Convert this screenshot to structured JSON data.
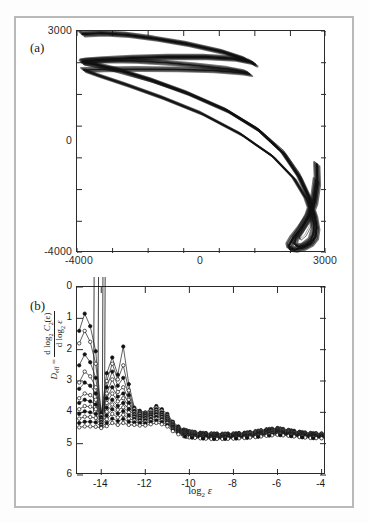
{
  "figure": {
    "panel_a": {
      "label": "(a)",
      "x_ticks": [
        "-4000",
        "0",
        "3000"
      ],
      "y_ticks": [
        "3000",
        "0",
        "-4000"
      ]
    },
    "panel_b": {
      "label": "(b)",
      "xlabel_base": "log",
      "xlabel_sub": "2",
      "xlabel_var": "ε",
      "ylabel_lhs": "D",
      "ylabel_lhs_sub": "eff",
      "ylabel_eq": "=",
      "ylabel_num_d": "d log",
      "ylabel_num_sub": "2",
      "ylabel_num_c": "C",
      "ylabel_num_csub": "2",
      "ylabel_num_eps": "(ε)",
      "ylabel_den_d": "d log",
      "ylabel_den_sub": "2",
      "ylabel_den_eps": "ε",
      "x_ticks": [
        "-14",
        "-12",
        "-10",
        "-8",
        "-6",
        "-4"
      ],
      "y_ticks": [
        "6",
        "5",
        "4",
        "3",
        "2",
        "1",
        "0"
      ]
    },
    "colors": {
      "axis": "#2a2a2a",
      "curve": "#111111",
      "page_border": "#b9b9b9",
      "background": "#ffffff"
    }
  },
  "chart_data": [
    {
      "type": "line",
      "title": "(a) Reconstructed attractor phase portrait",
      "xlabel": "",
      "ylabel": "",
      "xlim": [
        -4000,
        3000
      ],
      "ylim": [
        -4000,
        3000
      ],
      "x_ticks": [
        -4000,
        0,
        3000
      ],
      "y_ticks": [
        -4000,
        0,
        3000
      ],
      "grid": false,
      "legend": "none",
      "description": "Dense chaotic trajectory: a folded double-lobed band entering from upper-left near y=3000 and y=2000, sweeping right and downward through y=0 near x=2000, then looping into a narrow hairpin near (2000,-3800) and returning upward along x=2700.",
      "series": [
        {
          "name": "attractor-outer-band",
          "x": [
            -3850,
            -3300,
            -2600,
            -1800,
            -900,
            100,
            700,
            1000,
            900,
            400,
            -400,
            -1400,
            -2400,
            -3200,
            -3700,
            -3850,
            -3500,
            -2800,
            -1900,
            -900,
            200,
            1100,
            1800,
            2250,
            2520,
            2680,
            2740,
            2700,
            2560,
            2340,
            2120,
            1980,
            1960,
            2060,
            2260,
            2500,
            2680,
            2760,
            2740
          ],
          "y": [
            2900,
            2930,
            2880,
            2760,
            2590,
            2340,
            2120,
            1950,
            2020,
            2130,
            2180,
            2180,
            2150,
            2100,
            2060,
            2010,
            1950,
            1760,
            1450,
            1040,
            500,
            -120,
            -850,
            -1600,
            -2250,
            -2800,
            -3200,
            -3500,
            -3700,
            -3830,
            -3890,
            -3870,
            -3760,
            -3560,
            -3280,
            -2900,
            -2400,
            -1800,
            -1200
          ]
        },
        {
          "name": "attractor-inner-band",
          "x": [
            -3840,
            -3200,
            -2400,
            -1500,
            -600,
            300,
            760,
            860,
            600,
            -200,
            -1200,
            -2300,
            -3300,
            -3820,
            -3400,
            -2600,
            -1600,
            -500,
            600,
            1500,
            2100,
            2450,
            2620,
            2660,
            2580,
            2400,
            2220,
            2120,
            2140,
            2280,
            2490,
            2650,
            2720
          ],
          "y": [
            2050,
            2080,
            2060,
            2000,
            1910,
            1800,
            1700,
            1640,
            1690,
            1760,
            1790,
            1800,
            1790,
            1770,
            1600,
            1300,
            900,
            400,
            -250,
            -950,
            -1650,
            -2300,
            -2850,
            -3300,
            -3600,
            -3760,
            -3800,
            -3720,
            -3540,
            -3280,
            -2850,
            -2300,
            -1700
          ]
        },
        {
          "name": "attractor-thin-strand",
          "x": [
            -3840,
            -3000,
            -2000,
            -900,
            200,
            1100,
            1800,
            2250,
            2500,
            2600,
            2560,
            2420,
            2280,
            2230,
            2320,
            2520,
            2700
          ],
          "y": [
            1960,
            1740,
            1430,
            1030,
            520,
            -80,
            -760,
            -1480,
            -2150,
            -2750,
            -3150,
            -3450,
            -3580,
            -3480,
            -3240,
            -2780,
            -2200
          ]
        }
      ]
    },
    {
      "type": "line",
      "title": "(b) Effective dimension vs resolution",
      "xlabel": "log2 epsilon",
      "ylabel": "D_eff = d log2 C2(eps) / d log2 eps",
      "xlim": [
        -15.1,
        -3.8
      ],
      "ylim": [
        0,
        6
      ],
      "x_ticks": [
        -14,
        -12,
        -10,
        -8,
        -6,
        -4
      ],
      "y_ticks": [
        0,
        1,
        2,
        3,
        4,
        5,
        6
      ],
      "grid": false,
      "legend": "none",
      "markers": "open and filled circles",
      "description": "Family of ~12 local-slope curves (one per embedding dimension) that fan out and become noisy for log2(eps) < -12, including a few spikes that run off the top of the frame near -14.2, and collapse onto a common plateau of about 1.2-1.45 for log2(eps) > -10, with a mild bump near -11 and near -6.",
      "x": [
        -15.0,
        -14.75,
        -14.5,
        -14.25,
        -14.0,
        -13.75,
        -13.5,
        -13.25,
        -13.0,
        -12.75,
        -12.5,
        -12.25,
        -12.0,
        -11.75,
        -11.5,
        -11.25,
        -11.0,
        -10.75,
        -10.5,
        -10.25,
        -10.0,
        -9.5,
        -9.0,
        -8.5,
        -8.0,
        -7.5,
        -7.0,
        -6.5,
        -6.0,
        -5.5,
        -5.0,
        -4.5,
        -4.0
      ],
      "series": [
        {
          "name": "m=12",
          "values": [
            4.6,
            5.15,
            4.75,
            3.95,
            1.95,
            3.25,
            3.75,
            3.2,
            4.1,
            2.9,
            2.15,
            2.05,
            2.0,
            2.1,
            2.2,
            2.1,
            1.95,
            1.7,
            1.55,
            1.45,
            1.4,
            1.35,
            1.33,
            1.32,
            1.33,
            1.35,
            1.4,
            1.46,
            1.5,
            1.44,
            1.38,
            1.34,
            1.33
          ]
        },
        {
          "name": "m=11",
          "values": [
            4.2,
            4.6,
            4.25,
            3.55,
            1.9,
            3.0,
            3.55,
            3.05,
            3.5,
            2.7,
            2.1,
            2.0,
            1.98,
            2.05,
            2.15,
            2.05,
            1.9,
            1.67,
            1.52,
            1.43,
            1.38,
            1.33,
            1.31,
            1.3,
            1.31,
            1.33,
            1.38,
            1.44,
            1.48,
            1.42,
            1.36,
            1.32,
            1.31
          ]
        },
        {
          "name": "m=10",
          "values": [
            3.5,
            3.85,
            3.6,
            3.1,
            1.85,
            2.8,
            3.3,
            2.85,
            3.1,
            2.55,
            2.05,
            1.97,
            1.95,
            2.0,
            2.1,
            2.0,
            1.87,
            1.64,
            1.5,
            1.41,
            1.36,
            1.31,
            1.29,
            1.28,
            1.29,
            1.31,
            1.36,
            1.42,
            1.46,
            1.4,
            1.34,
            1.3,
            1.29
          ]
        },
        {
          "name": "m=9",
          "values": [
            2.95,
            3.3,
            3.15,
            2.8,
            1.8,
            2.6,
            3.05,
            2.65,
            2.8,
            2.4,
            2.0,
            1.94,
            1.92,
            1.97,
            2.06,
            1.96,
            1.84,
            1.62,
            1.48,
            1.39,
            1.34,
            1.29,
            1.27,
            1.26,
            1.27,
            1.29,
            1.34,
            1.4,
            1.44,
            1.38,
            1.32,
            1.28,
            1.27
          ]
        },
        {
          "name": "m=8",
          "values": [
            2.75,
            2.95,
            2.85,
            2.6,
            1.78,
            2.45,
            2.8,
            2.5,
            2.6,
            2.3,
            1.96,
            1.9,
            1.89,
            1.94,
            2.02,
            1.93,
            1.81,
            1.6,
            1.46,
            1.37,
            1.32,
            1.27,
            1.25,
            1.24,
            1.25,
            1.27,
            1.32,
            1.38,
            1.42,
            1.36,
            1.3,
            1.26,
            1.25
          ]
        },
        {
          "name": "m=7",
          "values": [
            2.45,
            2.6,
            2.55,
            2.4,
            1.74,
            2.3,
            2.6,
            2.35,
            2.45,
            2.2,
            1.92,
            1.87,
            1.86,
            1.91,
            1.99,
            1.9,
            1.78,
            1.57,
            1.44,
            1.35,
            1.3,
            1.25,
            1.23,
            1.22,
            1.23,
            1.25,
            1.3,
            1.36,
            1.4,
            1.34,
            1.28,
            1.25,
            1.24
          ]
        },
        {
          "name": "m=6",
          "values": [
            2.3,
            2.4,
            2.35,
            2.25,
            1.7,
            2.15,
            2.4,
            2.2,
            2.3,
            2.1,
            1.88,
            1.84,
            1.83,
            1.88,
            1.95,
            1.87,
            1.75,
            1.55,
            1.42,
            1.33,
            1.28,
            1.24,
            1.22,
            1.21,
            1.22,
            1.24,
            1.28,
            1.34,
            1.38,
            1.32,
            1.27,
            1.24,
            1.23
          ]
        },
        {
          "name": "m=5",
          "values": [
            2.1,
            2.2,
            2.18,
            2.1,
            1.66,
            2.02,
            2.25,
            2.08,
            2.16,
            2.0,
            1.84,
            1.8,
            1.79,
            1.84,
            1.9,
            1.83,
            1.72,
            1.52,
            1.4,
            1.31,
            1.26,
            1.22,
            1.2,
            1.2,
            1.21,
            1.23,
            1.27,
            1.32,
            1.36,
            1.31,
            1.26,
            1.23,
            1.22
          ]
        },
        {
          "name": "m=4",
          "values": [
            1.95,
            2.03,
            2.0,
            1.95,
            1.62,
            1.9,
            2.1,
            1.96,
            2.04,
            1.9,
            1.8,
            1.76,
            1.75,
            1.8,
            1.86,
            1.79,
            1.69,
            1.5,
            1.38,
            1.3,
            1.25,
            1.21,
            1.19,
            1.19,
            1.2,
            1.22,
            1.26,
            1.31,
            1.35,
            1.3,
            1.25,
            1.22,
            1.21
          ]
        },
        {
          "name": "m=3",
          "values": [
            1.8,
            1.86,
            1.85,
            1.82,
            1.58,
            1.78,
            1.95,
            1.84,
            1.92,
            1.8,
            1.74,
            1.71,
            1.7,
            1.75,
            1.8,
            1.74,
            1.65,
            1.47,
            1.36,
            1.28,
            1.24,
            1.2,
            1.18,
            1.18,
            1.19,
            1.21,
            1.25,
            1.3,
            1.33,
            1.28,
            1.24,
            1.21,
            1.2
          ]
        },
        {
          "name": "m=2",
          "values": [
            1.66,
            1.7,
            1.7,
            1.68,
            1.54,
            1.66,
            1.8,
            1.72,
            1.79,
            1.7,
            1.68,
            1.66,
            1.65,
            1.7,
            1.74,
            1.69,
            1.6,
            1.44,
            1.34,
            1.26,
            1.22,
            1.19,
            1.17,
            1.17,
            1.18,
            1.2,
            1.23,
            1.28,
            1.31,
            1.27,
            1.23,
            1.2,
            1.19
          ]
        },
        {
          "name": "m=1",
          "values": [
            1.52,
            1.55,
            1.55,
            1.54,
            1.5,
            1.56,
            1.66,
            1.6,
            1.66,
            1.6,
            1.6,
            1.58,
            1.58,
            1.62,
            1.66,
            1.62,
            1.55,
            1.4,
            1.3,
            1.24,
            1.2,
            1.17,
            1.15,
            1.15,
            1.16,
            1.18,
            1.21,
            1.25,
            1.28,
            1.25,
            1.21,
            1.18,
            1.17
          ]
        }
      ],
      "offscale_spikes": [
        {
          "at": -14.35,
          "note": "near-vertical excursion above D_eff = 6"
        },
        {
          "at": -14.15,
          "note": "near-vertical excursion above D_eff = 6"
        },
        {
          "at": -13.95,
          "note": "near-vertical excursion above D_eff = 6"
        },
        {
          "at": -13.85,
          "note": "near-vertical excursion above D_eff = 6"
        }
      ]
    }
  ]
}
